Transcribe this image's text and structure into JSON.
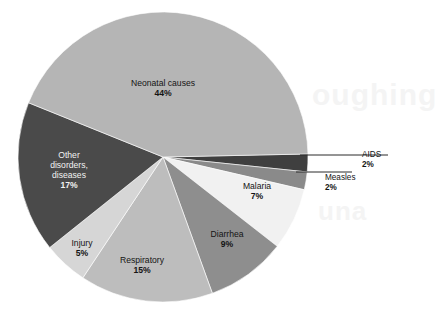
{
  "chart_data": {
    "type": "pie",
    "title": "",
    "subtitle": "",
    "xlabel": "",
    "ylabel": "",
    "legend_position": "none",
    "grid": false,
    "value_unit": "%",
    "categories": [
      "Neonatal causes",
      "AIDS",
      "Measles",
      "Malaria",
      "Diarrhea",
      "Respiratory",
      "Injury",
      "Other disorders, diseases"
    ],
    "values": [
      44,
      2,
      2,
      7,
      9,
      15,
      5,
      17
    ],
    "slices": [
      {
        "label": "Neonatal causes",
        "value": 44,
        "value_text": "44%",
        "color": "#b5b5b5",
        "label_placement": "inside",
        "label_text_color": "dark"
      },
      {
        "label": "AIDS",
        "value": 2,
        "value_text": "2%",
        "color": "#3f3f3f",
        "label_placement": "callout",
        "label_text_color": "dark"
      },
      {
        "label": "Measles",
        "value": 2,
        "value_text": "2%",
        "color": "#8a8a8a",
        "label_placement": "callout",
        "label_text_color": "dark"
      },
      {
        "label": "Malaria",
        "value": 7,
        "value_text": "7%",
        "color": "#f1f1f1",
        "label_placement": "inside",
        "label_text_color": "dark"
      },
      {
        "label": "Diarrhea",
        "value": 9,
        "value_text": "9%",
        "color": "#8e8e8e",
        "label_placement": "inside",
        "label_text_color": "dark"
      },
      {
        "label": "Respiratory",
        "value": 15,
        "value_text": "15%",
        "color": "#bdbdbd",
        "label_placement": "inside",
        "label_text_color": "dark"
      },
      {
        "label": "Injury",
        "value": 5,
        "value_text": "5%",
        "color": "#d6d6d6",
        "label_placement": "inside",
        "label_text_color": "dark"
      },
      {
        "label": "Other disorders, diseases",
        "value": 17,
        "value_text": "17%",
        "color": "#4a4a4a",
        "label_placement": "inside",
        "label_text_color": "light"
      }
    ]
  },
  "labels": {
    "neonatal": {
      "name": "Neonatal causes",
      "pct": "44%"
    },
    "other": {
      "name_line1": "Other",
      "name_line2": "disorders,",
      "name_line3": "diseases",
      "pct": "17%"
    },
    "injury": {
      "name": "Injury",
      "pct": "5%"
    },
    "respiratory": {
      "name": "Respiratory",
      "pct": "15%"
    },
    "diarrhea": {
      "name": "Diarrhea",
      "pct": "9%"
    },
    "malaria": {
      "name": "Malaria",
      "pct": "7%"
    },
    "aids": {
      "name": "AIDS",
      "pct": "2%"
    },
    "measles": {
      "name": "Measles",
      "pct": "2%"
    }
  },
  "background": {
    "watermark_line1": "oughing",
    "watermark_line2": "una"
  },
  "colors": {
    "page_background": "#ffffff",
    "text": "#141414",
    "text_on_dark": "#f2f2f2",
    "leader_line": "#2b2b2b"
  }
}
